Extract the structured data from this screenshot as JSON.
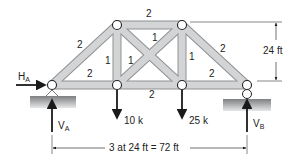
{
  "truss": {
    "member_labels": {
      "top_chord": "2",
      "left_diagonal": "2",
      "right_diagonal": "2",
      "bottom_left": "2",
      "bottom_middle": "2",
      "bottom_right": "2",
      "left_vertical": "1",
      "right_vertical": "1",
      "cross_a": "1",
      "cross_b": "1"
    }
  },
  "loads": {
    "load1": "10 k",
    "load2": "25 k"
  },
  "reactions": {
    "ha_main": "H",
    "ha_sub": "A",
    "va_main": "V",
    "va_sub": "A",
    "vb_main": "V",
    "vb_sub": "B"
  },
  "dimensions": {
    "height": "24 ft",
    "span": "3 at 24 ft = 72 ft"
  },
  "colors": {
    "member_fill": "#c9cbcc",
    "member_edge": "#8e9091",
    "ground": "#9a9c9d",
    "line": "#1a1a1a"
  }
}
